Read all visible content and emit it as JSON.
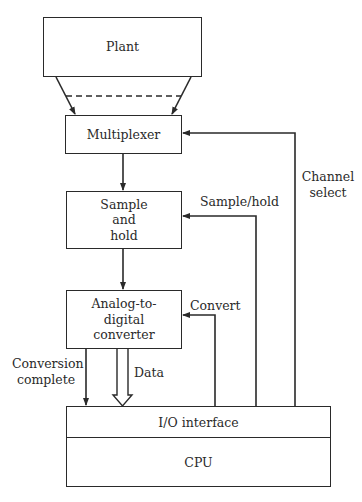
{
  "diagram": {
    "type": "block-diagram",
    "blocks": {
      "plant": {
        "label": "Plant"
      },
      "multiplexer": {
        "label": "Multiplexer"
      },
      "sample_hold": {
        "lines": [
          "Sample",
          "and",
          "hold"
        ]
      },
      "adc": {
        "lines": [
          "Analog-to-",
          "digital",
          "converter"
        ]
      },
      "io_interface": {
        "label": "I/O interface"
      },
      "cpu": {
        "label": "CPU"
      }
    },
    "signals": {
      "channel_select": {
        "lines": [
          "Channel",
          "select"
        ]
      },
      "sample_hold": {
        "label": "Sample/hold"
      },
      "convert": {
        "label": "Convert"
      },
      "conversion_complete": {
        "lines": [
          "Conversion",
          "complete"
        ]
      },
      "data": {
        "label": "Data"
      }
    },
    "connections": [
      {
        "from": "plant",
        "to": "multiplexer",
        "style": "multiple-lines-dashed"
      },
      {
        "from": "multiplexer",
        "to": "sample_hold",
        "style": "arrow"
      },
      {
        "from": "sample_hold",
        "to": "adc",
        "style": "arrow"
      },
      {
        "from": "io_interface",
        "to": "multiplexer",
        "label": "Channel select",
        "style": "arrow"
      },
      {
        "from": "io_interface",
        "to": "sample_hold",
        "label": "Sample/hold",
        "style": "arrow"
      },
      {
        "from": "io_interface",
        "to": "adc",
        "label": "Convert",
        "style": "arrow"
      },
      {
        "from": "adc",
        "to": "io_interface",
        "label": "Conversion complete",
        "style": "arrow"
      },
      {
        "from": "adc",
        "to": "io_interface",
        "label": "Data",
        "style": "bus-arrow"
      }
    ],
    "colors": {
      "line": "#2a2a2a",
      "background": "#ffffff"
    }
  }
}
